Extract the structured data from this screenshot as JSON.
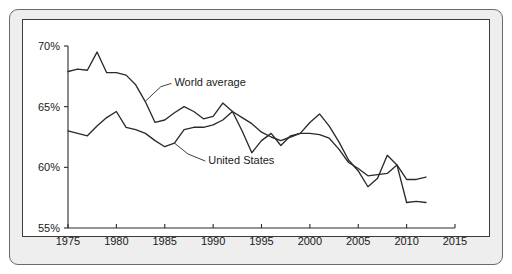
{
  "chart_data": {
    "type": "line",
    "title": "",
    "subtitle": "",
    "xlabel": "",
    "ylabel": "",
    "xlim": [
      1975,
      2015
    ],
    "ylim": [
      55,
      70
    ],
    "grid": false,
    "legend_position": "inline-annotation",
    "x_ticks": [
      1975,
      1980,
      1985,
      1990,
      1995,
      2000,
      2005,
      2010,
      2015
    ],
    "x_tick_labels": [
      "1975",
      "1980",
      "1985",
      "1990",
      "1995",
      "2000",
      "2005",
      "2010",
      "2015"
    ],
    "y_ticks": [
      55,
      60,
      65,
      70
    ],
    "y_tick_labels": [
      "55%",
      "60%",
      "65%",
      "70%"
    ],
    "series": [
      {
        "name": "World average",
        "label": "World average",
        "x": [
          1975,
          1976,
          1977,
          1978,
          1979,
          1980,
          1981,
          1982,
          1983,
          1984,
          1985,
          1986,
          1987,
          1988,
          1989,
          1990,
          1991,
          1992,
          1993,
          1994,
          1995,
          1996,
          1997,
          1998,
          1999,
          2000,
          2001,
          2002,
          2003,
          2004,
          2005,
          2006,
          2007,
          2008,
          2009,
          2010,
          2011,
          2012
        ],
        "values": [
          67.9,
          68.1,
          68.0,
          69.5,
          67.8,
          67.8,
          67.6,
          66.8,
          65.4,
          63.7,
          63.9,
          64.5,
          65.0,
          64.6,
          64.0,
          64.2,
          65.3,
          64.6,
          63.0,
          61.2,
          62.2,
          62.8,
          61.8,
          62.6,
          62.8,
          63.7,
          64.4,
          63.4,
          62.1,
          60.6,
          59.7,
          58.4,
          59.1,
          61.0,
          60.2,
          57.1,
          57.2,
          57.1
        ]
      },
      {
        "name": "United States",
        "label": "United States",
        "x": [
          1975,
          1976,
          1977,
          1978,
          1979,
          1980,
          1981,
          1982,
          1983,
          1984,
          1985,
          1986,
          1987,
          1988,
          1989,
          1990,
          1991,
          1992,
          1993,
          1994,
          1995,
          1996,
          1997,
          1998,
          1999,
          2000,
          2001,
          2002,
          2003,
          2004,
          2005,
          2006,
          2007,
          2008,
          2009,
          2010,
          2011,
          2012
        ],
        "values": [
          63.0,
          62.8,
          62.6,
          63.4,
          64.1,
          64.6,
          63.3,
          63.1,
          62.8,
          62.2,
          61.7,
          62.0,
          63.1,
          63.3,
          63.3,
          63.5,
          63.9,
          64.6,
          64.1,
          63.6,
          62.9,
          62.5,
          62.2,
          62.5,
          62.8,
          62.8,
          62.7,
          62.4,
          61.5,
          60.4,
          59.9,
          59.3,
          59.4,
          59.5,
          60.2,
          59.0,
          59.0,
          59.2
        ]
      }
    ],
    "annotations": [
      {
        "text": "World average",
        "x_anchor": 1986.0,
        "y_anchor": 67.0
      },
      {
        "text": "United States",
        "x_anchor": 1989.5,
        "y_anchor": 60.6
      }
    ]
  },
  "figure": {
    "border_color": "#6b6b6b",
    "panel_background": "#ffffff",
    "bezel_background": "#eeeeee",
    "line_color": "#2b2b2b",
    "text_color": "#1a1a1a"
  }
}
